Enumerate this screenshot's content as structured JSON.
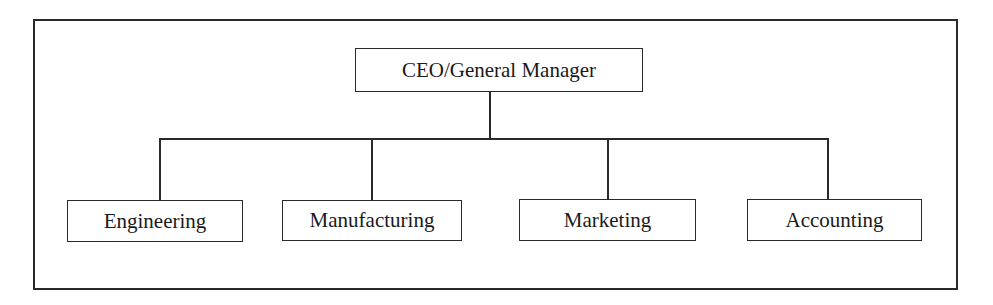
{
  "diagram": {
    "type": "org-chart",
    "root": {
      "label": "CEO/General Manager"
    },
    "children": [
      {
        "label": "Engineering"
      },
      {
        "label": "Manufacturing"
      },
      {
        "label": "Marketing"
      },
      {
        "label": "Accounting"
      }
    ],
    "colors": {
      "line": "#2a2a2a",
      "background": "#ffffff",
      "text": "#1a1a1a"
    }
  }
}
